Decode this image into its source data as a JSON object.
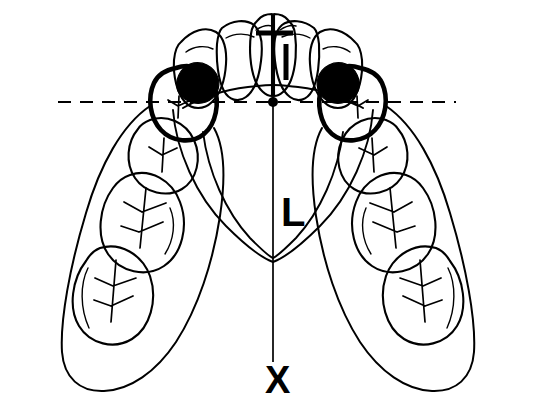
{
  "figure": {
    "background_color": "#ffffff",
    "ink_color": "#000000",
    "width": 536,
    "height": 417
  },
  "labels": {
    "incisor_marker": "I",
    "midline_label": "L",
    "terminus_label": "X"
  },
  "reference_line": {
    "name": "horizontal-dashed-reference-line",
    "style": "dashed",
    "y": 102,
    "x_start": 58,
    "x_end": 456
  },
  "midline": {
    "name": "vertical-midline",
    "x": 273,
    "y_start": 30,
    "y_end": 362
  },
  "center_point": {
    "name": "arch-center-point",
    "x": 273,
    "y": 102,
    "radius": 5
  },
  "anterior_teeth": [
    {
      "id": "upper-left-canine",
      "position": "left-3",
      "notation": "23"
    },
    {
      "id": "upper-left-lateral-incisor",
      "position": "left-2",
      "notation": "22"
    },
    {
      "id": "upper-left-central-incisor",
      "position": "left-1",
      "notation": "21"
    },
    {
      "id": "upper-right-central-incisor",
      "position": "right-1",
      "notation": "11"
    },
    {
      "id": "upper-right-lateral-incisor",
      "position": "right-2",
      "notation": "12"
    },
    {
      "id": "upper-right-canine",
      "position": "right-3",
      "notation": "13"
    }
  ],
  "posterior_teeth": {
    "left": [
      {
        "id": "upper-left-first-premolar",
        "notation": "24",
        "highlighted": true,
        "lesion": true
      },
      {
        "id": "upper-left-second-premolar",
        "notation": "25",
        "highlighted": false,
        "lesion": false
      },
      {
        "id": "upper-left-first-molar",
        "notation": "26",
        "highlighted": false,
        "lesion": false
      },
      {
        "id": "upper-left-second-molar",
        "notation": "27",
        "highlighted": false,
        "lesion": false
      }
    ],
    "right": [
      {
        "id": "upper-right-first-premolar",
        "notation": "14",
        "highlighted": true,
        "lesion": true
      },
      {
        "id": "upper-right-second-premolar",
        "notation": "15",
        "highlighted": false,
        "lesion": false
      },
      {
        "id": "upper-right-first-molar",
        "notation": "16",
        "highlighted": false,
        "lesion": false
      },
      {
        "id": "upper-right-second-molar",
        "notation": "17",
        "highlighted": false,
        "lesion": false
      }
    ]
  },
  "lesions": [
    {
      "id": "left-premolar-lesion",
      "side": "left",
      "shading": "solid-black"
    },
    {
      "id": "right-premolar-lesion",
      "side": "right",
      "shading": "solid-black"
    }
  ]
}
